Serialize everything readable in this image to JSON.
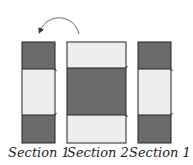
{
  "diagram": {
    "colors": {
      "dark": "#6b6b6b",
      "light": "#eeeeee",
      "stroke": "#222222",
      "arrow": "#555555"
    },
    "panels": [
      {
        "label": "Section 1",
        "bands": [
          "dark",
          "light",
          "dark"
        ]
      },
      {
        "label": "Section 2",
        "bands": [
          "light",
          "dark",
          "light"
        ]
      },
      {
        "label": "Section 1",
        "bands": [
          "dark",
          "light",
          "dark"
        ]
      }
    ],
    "arrow": {
      "from": "Section 2",
      "to": "Section 1",
      "direction": "curved-left"
    }
  }
}
